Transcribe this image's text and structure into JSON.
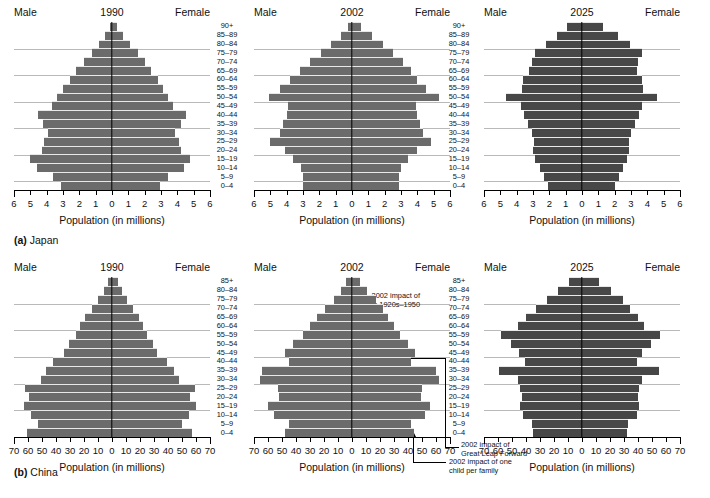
{
  "figure": {
    "rows": [
      {
        "caption_label": "(a)",
        "caption_text": "Japan"
      },
      {
        "caption_label": "(b)",
        "caption_text": "China"
      }
    ]
  },
  "labels": {
    "male": "Male",
    "female": "Female",
    "axis_title": "Population (in millions)"
  },
  "age_groups_japan": [
    "90+",
    "85–89",
    "80–84",
    "75–79",
    "70–74",
    "65–69",
    "60–64",
    "55–59",
    "50–54",
    "45–49",
    "40–44",
    "35–39",
    "30–34",
    "25–29",
    "20–24",
    "15–19",
    "10–14",
    "5–9",
    "0–4"
  ],
  "age_groups_china": [
    "85+",
    "80–84",
    "75–79",
    "70–74",
    "65–69",
    "60–64",
    "55–59",
    "50–54",
    "45–49",
    "40–44",
    "35–39",
    "30–34",
    "25–29",
    "20–24",
    "15–19",
    "10–14",
    "5–9",
    "0–4"
  ],
  "annotations": {
    "wars": "2002 impact of\nwars 1920s–1950",
    "wars_line1": "2002 impact of",
    "wars_line2": "wars 1920s–1950",
    "great_leap_line1": "2002 impact of",
    "great_leap_line2": "Great Leap Forward",
    "one_child_line1": "2002 impact of one",
    "one_child_line2": "child per family"
  },
  "colors": {
    "bar_light": "#6b6b6b",
    "bar_dark": "#474747",
    "grid": "#b9b9b9",
    "axis": "#000000"
  },
  "chart_data": [
    {
      "id": "japan-1990",
      "type": "bar",
      "orientation": "population-pyramid",
      "title": "1990",
      "country": "Japan",
      "xlabel": "Population (in millions)",
      "ylabel": "",
      "xlim": [
        -6,
        6
      ],
      "xticks": [
        6,
        5,
        4,
        3,
        2,
        1,
        0,
        1,
        2,
        3,
        4,
        5,
        6
      ],
      "grid": true,
      "legend": "Male (left) / Female (right)",
      "categories": [
        "90+",
        "85–89",
        "80–84",
        "75–79",
        "70–74",
        "65–69",
        "60–64",
        "55–59",
        "50–54",
        "45–49",
        "40–44",
        "35–39",
        "30–34",
        "25–29",
        "20–24",
        "15–19",
        "10–14",
        "5–9",
        "0–4"
      ],
      "series": [
        {
          "name": "Male",
          "values": [
            0.15,
            0.45,
            0.8,
            1.25,
            1.7,
            2.2,
            2.6,
            3.0,
            3.35,
            3.7,
            4.55,
            4.25,
            3.9,
            4.15,
            4.3,
            5.0,
            4.6,
            3.6,
            3.1
          ]
        },
        {
          "name": "Female",
          "values": [
            0.3,
            0.65,
            1.1,
            1.6,
            2.0,
            2.4,
            2.8,
            3.1,
            3.4,
            3.75,
            4.5,
            4.2,
            3.85,
            4.1,
            4.25,
            4.8,
            4.4,
            3.45,
            2.95
          ]
        }
      ]
    },
    {
      "id": "japan-2002",
      "type": "bar",
      "orientation": "population-pyramid",
      "title": "2002",
      "country": "Japan",
      "xlabel": "Population (in millions)",
      "ylabel": "",
      "xlim": [
        -6,
        6
      ],
      "xticks": [
        6,
        5,
        4,
        3,
        2,
        1,
        0,
        1,
        2,
        3,
        4,
        5,
        6
      ],
      "grid": true,
      "legend": "Male (left) / Female (right)",
      "categories": [
        "90+",
        "85–89",
        "80–84",
        "75–79",
        "70–74",
        "65–69",
        "60–64",
        "55–59",
        "50–54",
        "45–49",
        "40–44",
        "35–39",
        "30–34",
        "25–29",
        "20–24",
        "15–19",
        "10–14",
        "5–9",
        "0–4"
      ],
      "series": [
        {
          "name": "Male",
          "values": [
            0.25,
            0.7,
            1.3,
            1.9,
            2.6,
            3.2,
            3.8,
            4.4,
            5.1,
            3.9,
            4.0,
            4.2,
            4.4,
            5.0,
            4.1,
            3.6,
            3.1,
            3.0,
            3.0
          ]
        },
        {
          "name": "Female",
          "values": [
            0.55,
            1.2,
            1.9,
            2.5,
            3.1,
            3.6,
            4.0,
            4.5,
            5.3,
            3.9,
            4.0,
            4.15,
            4.35,
            4.85,
            4.0,
            3.45,
            3.0,
            2.9,
            2.9
          ]
        }
      ]
    },
    {
      "id": "japan-2025",
      "type": "bar",
      "orientation": "population-pyramid",
      "title": "2025",
      "country": "Japan",
      "xlabel": "Population (in millions)",
      "ylabel": "",
      "xlim": [
        -6,
        6
      ],
      "xticks": [
        6,
        5,
        4,
        3,
        2,
        1,
        0,
        1,
        2,
        3,
        4,
        5,
        6
      ],
      "grid": true,
      "legend": "Male (left) / Female (right)",
      "categories": [
        "90+",
        "85–89",
        "80–84",
        "75–79",
        "70–74",
        "65–69",
        "60–64",
        "55–59",
        "50–54",
        "45–49",
        "40–44",
        "35–39",
        "30–34",
        "25–29",
        "20–24",
        "15–19",
        "10–14",
        "5–9",
        "0–4"
      ],
      "series": [
        {
          "name": "Male",
          "values": [
            0.9,
            1.55,
            2.2,
            2.85,
            3.05,
            3.25,
            3.6,
            3.7,
            4.65,
            3.75,
            3.55,
            3.3,
            3.05,
            2.95,
            3.0,
            2.85,
            2.6,
            2.35,
            2.1
          ]
        },
        {
          "name": "Female",
          "values": [
            1.3,
            2.2,
            2.95,
            3.65,
            3.4,
            3.35,
            3.7,
            3.75,
            4.6,
            3.7,
            3.5,
            3.25,
            3.0,
            2.9,
            2.9,
            2.75,
            2.5,
            2.25,
            2.0
          ]
        }
      ]
    },
    {
      "id": "china-1990",
      "type": "bar",
      "orientation": "population-pyramid",
      "title": "1990",
      "country": "China",
      "xlabel": "Population (in millions)",
      "ylabel": "",
      "xlim": [
        -70,
        70
      ],
      "xticks": [
        70,
        60,
        50,
        40,
        30,
        20,
        10,
        0,
        10,
        20,
        30,
        40,
        50,
        60,
        70
      ],
      "grid": true,
      "legend": "Male (left) / Female (right)",
      "categories": [
        "85+",
        "80–84",
        "75–79",
        "70–74",
        "65–69",
        "60–64",
        "55–59",
        "50–54",
        "45–49",
        "40–44",
        "35–39",
        "30–34",
        "25–29",
        "20–24",
        "15–19",
        "10–14",
        "5–9",
        "0–4"
      ],
      "series": [
        {
          "name": "Male",
          "values": [
            3,
            6,
            10,
            14,
            19,
            23,
            26,
            31,
            34,
            42,
            47,
            51,
            62,
            59,
            63,
            58,
            53,
            61
          ]
        },
        {
          "name": "Female",
          "values": [
            4,
            7,
            11,
            15,
            19,
            22,
            25,
            29,
            32,
            39,
            44,
            48,
            59,
            56,
            60,
            55,
            50,
            57
          ]
        }
      ]
    },
    {
      "id": "china-2002",
      "type": "bar",
      "orientation": "population-pyramid",
      "title": "2002",
      "country": "China",
      "xlabel": "Population (in millions)",
      "ylabel": "",
      "xlim": [
        -70,
        70
      ],
      "xticks": [
        70,
        60,
        50,
        40,
        30,
        20,
        10,
        0,
        10,
        20,
        30,
        40,
        50,
        60,
        70
      ],
      "grid": true,
      "legend": "Male (left) / Female (right)",
      "categories": [
        "85+",
        "80–84",
        "75–79",
        "70–74",
        "65–69",
        "60–64",
        "55–59",
        "50–54",
        "45–49",
        "40–44",
        "35–39",
        "30–34",
        "25–29",
        "20–24",
        "15–19",
        "10–14",
        "5–9",
        "0–4"
      ],
      "series": [
        {
          "name": "Male",
          "values": [
            4,
            8,
            13,
            19,
            25,
            30,
            35,
            42,
            48,
            45,
            64,
            66,
            53,
            52,
            60,
            56,
            45,
            48
          ]
        },
        {
          "name": "Female",
          "values": [
            6,
            11,
            17,
            22,
            26,
            30,
            34,
            40,
            45,
            42,
            60,
            62,
            50,
            49,
            56,
            52,
            42,
            44
          ]
        }
      ],
      "annotations": [
        {
          "text": "2002 impact of wars 1920s–1950",
          "target_category": "70–74"
        },
        {
          "text": "2002 impact of Great Leap Forward",
          "target_category": "40–44"
        },
        {
          "text": "2002 impact of one child per family",
          "target_category": "0–4"
        }
      ]
    },
    {
      "id": "china-2025",
      "type": "bar",
      "orientation": "population-pyramid",
      "title": "2025",
      "country": "China",
      "xlabel": "Population (in millions)",
      "ylabel": "",
      "xlim": [
        -70,
        70
      ],
      "xticks": [
        70,
        60,
        50,
        40,
        30,
        20,
        10,
        0,
        10,
        20,
        30,
        40,
        50,
        60,
        70
      ],
      "grid": true,
      "legend": "Male (left) / Female (right)",
      "categories": [
        "85+",
        "80–84",
        "75–79",
        "70–74",
        "65–69",
        "60–64",
        "55–59",
        "50–54",
        "45–49",
        "40–44",
        "35–39",
        "30–34",
        "25–29",
        "20–24",
        "15–19",
        "10–14",
        "5–9",
        "0–4"
      ],
      "series": [
        {
          "name": "Male",
          "values": [
            9,
            17,
            25,
            33,
            40,
            46,
            58,
            51,
            45,
            41,
            59,
            46,
            44,
            43,
            44,
            42,
            36,
            35
          ]
        },
        {
          "name": "Female",
          "values": [
            12,
            21,
            29,
            34,
            40,
            44,
            56,
            49,
            43,
            39,
            55,
            43,
            41,
            40,
            41,
            39,
            33,
            32
          ]
        }
      ]
    }
  ]
}
